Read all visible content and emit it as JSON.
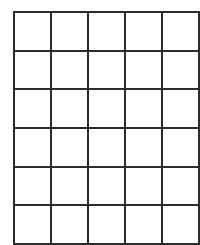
{
  "page": {
    "background_color": "#ffffff",
    "width": 199,
    "height": 241
  },
  "grid": {
    "name": "blank-grid",
    "columns": 5,
    "rows": 6,
    "line_color": "#2b2b2b",
    "line_width_px": 2,
    "cell_fill_color": "#ffffff",
    "cell_width_px": 35,
    "cell_height_px": 36.66,
    "origin_x_px": 13,
    "origin_y_px": 11,
    "total_width_px": 175,
    "total_height_px": 220,
    "cells": [
      [
        "",
        "",
        "",
        "",
        ""
      ],
      [
        "",
        "",
        "",
        "",
        ""
      ],
      [
        "",
        "",
        "",
        "",
        ""
      ],
      [
        "",
        "",
        "",
        "",
        ""
      ],
      [
        "",
        "",
        "",
        "",
        ""
      ],
      [
        "",
        "",
        "",
        "",
        ""
      ]
    ]
  }
}
